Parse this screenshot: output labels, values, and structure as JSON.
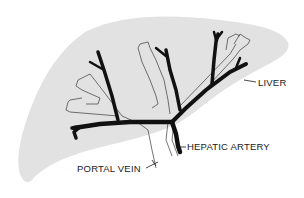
{
  "diagram": {
    "type": "anatomical-illustration",
    "colors": {
      "liver_fill": "#e2e2e2",
      "artery": "#111111",
      "vein_outline": "#3a3a3a",
      "background": "#ffffff",
      "label_text": "#1a1a1a"
    },
    "labels": [
      {
        "id": "liver",
        "text": "LIVER"
      },
      {
        "id": "hepatic_artery",
        "text": "HEPATIC ARTERY"
      },
      {
        "id": "portal_vein",
        "text": "PORTAL VEIN"
      }
    ]
  }
}
